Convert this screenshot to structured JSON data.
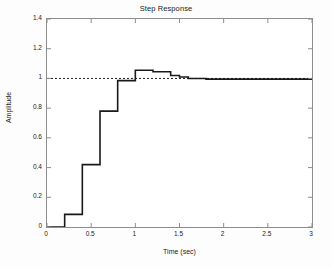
{
  "chart_data": {
    "type": "line",
    "title": "Step Response",
    "xlabel": "Time (sec)",
    "ylabel": "Amplitude",
    "xlim": [
      0,
      3
    ],
    "ylim": [
      0,
      1.4
    ],
    "grid": false,
    "legend": null,
    "style": "staircase",
    "line_color": "#1a1a1a",
    "reference_color": "#1a1a1a",
    "xticks": [
      0,
      0.5,
      1,
      1.5,
      2,
      2.5,
      3
    ],
    "xticklabels": [
      "0",
      "0.5",
      "1",
      "1.5",
      "2",
      "2.5",
      "3"
    ],
    "yticks": [
      0,
      0.2,
      0.4,
      0.6,
      0.8,
      1,
      1.2,
      1.4
    ],
    "yticklabels": [
      "0",
      "0.2",
      "0.4",
      "0.6",
      "0.8",
      "1",
      "1.2",
      "1.4"
    ],
    "series": [
      {
        "name": "step response",
        "style": "solid",
        "x": [
          0.0,
          0.2,
          0.4,
          0.6,
          0.8,
          1.0,
          1.2,
          1.4,
          1.5,
          1.6,
          1.8,
          2.0,
          2.2,
          2.4,
          2.6,
          2.8,
          3.0
        ],
        "values": [
          0.0,
          0.085,
          0.42,
          0.78,
          0.985,
          1.055,
          1.045,
          1.02,
          1.01,
          1.0,
          0.995,
          0.995,
          0.995,
          0.995,
          0.995,
          0.995,
          0.995
        ]
      },
      {
        "name": "reference",
        "style": "dotted",
        "x": [
          0.0,
          3.0
        ],
        "values": [
          1.0,
          1.0
        ]
      }
    ],
    "annotations": []
  }
}
